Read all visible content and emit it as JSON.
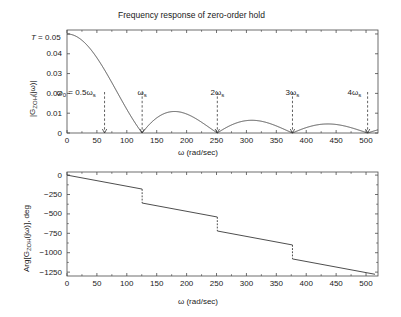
{
  "figure": {
    "background": "#ffffff",
    "line_color": "#3a3a3a",
    "axis_color": "#4a4a4a",
    "text_color": "#1a1a1a"
  },
  "top_panel": {
    "title": "Frequency response of zero-order hold",
    "ylabel": "|G_ZOH(jω)|",
    "ylabel_parts": {
      "pre": "|G",
      "sub": "ZOH",
      "post": "(jω)|"
    },
    "xlabel": "ω (rad/sec)",
    "corner_label": "T = 0.05",
    "ytick_labels": [
      "0.05",
      "0.04",
      "0.03",
      "0.02",
      "0.01",
      "0"
    ],
    "ytick_values": [
      0.05,
      0.04,
      0.03,
      0.02,
      0.01,
      0
    ],
    "xtick_labels": [
      "0",
      "50",
      "100",
      "150",
      "200",
      "250",
      "300",
      "350",
      "400",
      "450",
      "500"
    ],
    "xtick_values": [
      0,
      50,
      100,
      150,
      200,
      250,
      300,
      350,
      400,
      450,
      500
    ],
    "annotations": [
      {
        "name": "omega0-marker",
        "text_pre": "ω",
        "text_sub": "0",
        "text_post": " = 0.5ω",
        "text_sub2": "s",
        "x": 62.8
      },
      {
        "name": "omegas-marker",
        "text_pre": "ω",
        "text_sub": "s",
        "text_post": "",
        "text_sub2": "",
        "x": 125.66
      },
      {
        "name": "2omegas-marker",
        "text_pre": "2ω",
        "text_sub": "s",
        "text_post": "",
        "text_sub2": "",
        "x": 251.33
      },
      {
        "name": "3omegas-marker",
        "text_pre": "3ω",
        "text_sub": "s",
        "text_post": "",
        "text_sub2": "",
        "x": 376.99
      },
      {
        "name": "4omegas-marker",
        "text_pre": "4ω",
        "text_sub": "s",
        "text_post": "",
        "text_sub2": "",
        "x": 502.65
      }
    ]
  },
  "bottom_panel": {
    "ylabel": "Arg[G_ZOH(jω)], deg",
    "ylabel_parts": {
      "pre": "Arg[G",
      "sub": "ZOH",
      "post": "(jω)], deg"
    },
    "xlabel": "ω (rad/sec)",
    "ytick_labels": [
      "0",
      "−250",
      "−500",
      "−750",
      "−1000",
      "−1250"
    ],
    "ytick_values": [
      0,
      -250,
      -500,
      -750,
      -1000,
      -1250
    ],
    "xtick_labels": [
      "0",
      "50",
      "100",
      "150",
      "200",
      "250",
      "300",
      "350",
      "400",
      "450",
      "500"
    ],
    "xtick_values": [
      0,
      50,
      100,
      150,
      200,
      250,
      300,
      350,
      400,
      450,
      500
    ]
  },
  "chart_data": [
    {
      "type": "line",
      "name": "zoh-magnitude",
      "title": "Frequency response of zero-order hold",
      "xlabel": "ω (rad/sec)",
      "ylabel": "|G_ZOH(jω)|",
      "xlim": [
        0,
        520
      ],
      "ylim": [
        0,
        0.052
      ],
      "grid": false,
      "legend": "none",
      "sampling_period_T": 0.05,
      "omega_s": 125.66,
      "formula": "|G| = T*|sinc(wT/2)| = |2*sin(wT/2)/w|",
      "annotations": [
        "ω₀ = 0.5ωs at 62.8",
        "ωs at 125.66",
        "2ωs at 251.33",
        "3ωs at 376.99",
        "4ωs at 502.65"
      ],
      "key_points": [
        {
          "x": 0,
          "y": 0.05
        },
        {
          "x": 62.8,
          "y": 0.0318
        },
        {
          "x": 125.66,
          "y": 0.0
        },
        {
          "x": 180,
          "y": 0.0106
        },
        {
          "x": 251.33,
          "y": 0.0
        },
        {
          "x": 310,
          "y": 0.0064
        },
        {
          "x": 376.99,
          "y": 0.0
        },
        {
          "x": 440,
          "y": 0.0045
        },
        {
          "x": 502.65,
          "y": 0.0
        }
      ]
    },
    {
      "type": "line",
      "name": "zoh-phase",
      "title": "",
      "xlabel": "ω (rad/sec)",
      "ylabel": "Arg[G_ZOH(jω)], deg",
      "xlim": [
        0,
        520
      ],
      "ylim": [
        -1300,
        40
      ],
      "grid": false,
      "legend": "none",
      "formula": "Arg = -w*T/2 (deg) with -180 deg drop at each multiple of ws",
      "jumps_at": [
        125.66,
        251.33,
        376.99
      ],
      "jump_size_deg": -180,
      "key_points": [
        {
          "x": 0,
          "y": 0
        },
        {
          "x": 125.66,
          "y": -180
        },
        {
          "x": 125.66,
          "y": -360
        },
        {
          "x": 251.33,
          "y": -540
        },
        {
          "x": 251.33,
          "y": -720
        },
        {
          "x": 376.99,
          "y": -900
        },
        {
          "x": 376.99,
          "y": -1080
        },
        {
          "x": 510,
          "y": -1260
        }
      ]
    }
  ]
}
